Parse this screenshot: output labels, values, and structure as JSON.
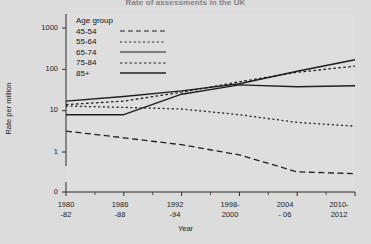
{
  "chart_data": {
    "type": "line",
    "title": "Rate of assessments in the UK",
    "xlabel": "Year",
    "ylabel": "Rate per million",
    "yscale": "log",
    "yticks": [
      0,
      1,
      10,
      100,
      1000
    ],
    "ytick_labels": [
      "0",
      "1",
      "10",
      "100",
      "1000"
    ],
    "ylim": [
      0,
      1000
    ],
    "axis_break": true,
    "grid": false,
    "legend_position": "top-left",
    "legend_title": "Age group",
    "categories": [
      "1980-82",
      "1986-88",
      "1992-94",
      "1998-2000",
      "2004-06",
      "2010-2012"
    ],
    "xtick_labels": [
      {
        "line1": "1980",
        "line2": "-82"
      },
      {
        "line1": "1986",
        "line2": "-88"
      },
      {
        "line1": "1992",
        "line2": "-94"
      },
      {
        "line1": "1998-",
        "line2": "2000"
      },
      {
        "line1": "2004",
        "line2": "- 06"
      },
      {
        "line1": "2010-",
        "line2": "2012"
      }
    ],
    "series": [
      {
        "name": "45-54",
        "style": "long-dash",
        "values": [
          3.2,
          2.2,
          1.5,
          0.85,
          0.33,
          0.3
        ]
      },
      {
        "name": "55-64",
        "style": "fine-dot",
        "values": [
          13.0,
          12.0,
          11.0,
          8.0,
          5.2,
          4.2
        ]
      },
      {
        "name": "65-74",
        "style": "solid",
        "values": [
          17.0,
          22.0,
          30.0,
          45.0,
          90.0,
          170.0
        ]
      },
      {
        "name": "75-84",
        "style": "dot",
        "values": [
          14.0,
          17.0,
          28.0,
          50.0,
          85.0,
          120.0
        ]
      },
      {
        "name": "85+",
        "style": "solid",
        "values": [
          8.0,
          8.0,
          25.0,
          42.0,
          38.0,
          40.0
        ]
      }
    ]
  },
  "legend": {
    "title": "Age group",
    "entries": [
      {
        "label": "45-54"
      },
      {
        "label": "55-64"
      },
      {
        "label": "65-74"
      },
      {
        "label": "75-84"
      },
      {
        "label": "85+"
      }
    ]
  },
  "axes": {
    "y_title": "Rate per million",
    "x_title": "Year",
    "y_ticks": [
      "1000",
      "100",
      "10",
      "1",
      "0"
    ]
  }
}
